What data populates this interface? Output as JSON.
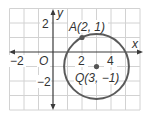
{
  "diagram": {
    "type": "coordinate-plane-circle",
    "grid": {
      "x_min": -3,
      "x_max": 6,
      "y_min": -4,
      "y_max": 3,
      "unit_px": 14.5
    },
    "axes": {
      "x_label": "x",
      "y_label": "y",
      "origin_label": "O"
    },
    "tick_labels": {
      "x_neg2": "−2",
      "x_2": "2",
      "x_4": "4",
      "y_2": "2",
      "y_neg2": "−2"
    },
    "points": {
      "A": {
        "label": "A(2, 1)",
        "x": 2,
        "y": 1
      },
      "Q": {
        "label": "Q(3, −1)",
        "x": 3,
        "y": -1
      }
    },
    "circle": {
      "center": "Q",
      "through": "A",
      "radius": 2.236
    },
    "colors": {
      "grid": "#cfcfcf",
      "axis": "#3a3a3a",
      "circle": "#5a5a5a",
      "point": "#555555",
      "text": "#333333"
    }
  }
}
